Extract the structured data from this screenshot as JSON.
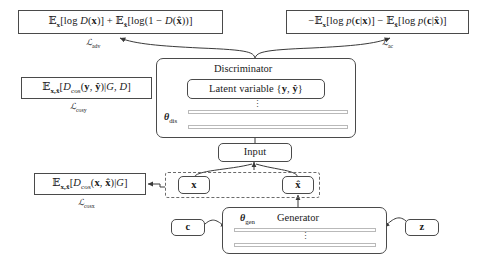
{
  "diagram": {
    "type": "block-diagram",
    "background_color": "#ffffff",
    "line_color": "#4a4a4a",
    "dashed_color": "#6b6b6b"
  },
  "boxes": {
    "adv_formula": "ᴇₓ[log D(x)] + ᴇₓ̂[log(1 − D(x̂))]",
    "ac_formula": "−ᴇₓ[log p(c|x)] − ᴇₓ̂[log p(c|x̂)]",
    "cosy_formula": "ᴇₓ,ₓ̂[Dₑₒₛ(y, ŷ)|G, D]",
    "cosx_formula": "ᴇₓ,ₓ̂[Dₑₒₛ(x, x̂)|G]",
    "latent_variable": "Latent variable {y, ŷ}",
    "discriminator": "Discriminator",
    "generator": "Generator",
    "input": "Input",
    "x": "x",
    "x_hat": "x̂",
    "c": "c",
    "z": "z"
  },
  "labels": {
    "loss_adv": "ℒadv",
    "loss_ac": "ℒac",
    "loss_cosy": "ℒcosy",
    "loss_cosx": "ℒcosx",
    "theta_dis": "θdis",
    "theta_gen": "θgen",
    "ellipsis": "⋮"
  },
  "loss_subscripts": {
    "adv": "adv",
    "ac": "ac",
    "cosy": "cosy",
    "cosx": "cosx",
    "dis": "dis",
    "gen": "gen"
  },
  "symbols": {
    "expectation": "𝔼",
    "script_L": "ℒ",
    "theta": "θ",
    "hat": "̂"
  }
}
